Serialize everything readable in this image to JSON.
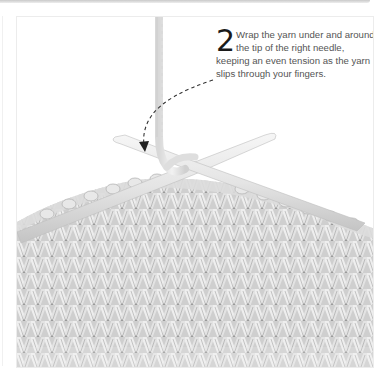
{
  "step": {
    "number": "2",
    "text": "Wrap the yarn under and around the tip of the right needle, keeping an even tension as the yarn slips through your fingers."
  },
  "illustration": {
    "subject": "knitting-right-needle-yarn-wrap",
    "elements": [
      "yarn-strand",
      "dashed-direction-arrow",
      "left-needle",
      "right-needle",
      "stockinette-fabric"
    ],
    "colors": {
      "yarn": "#e6e6e6",
      "yarn_shadow": "#a8a8a8",
      "needle": "#e9e9e9",
      "arrow": "#333333",
      "text": "#555555",
      "numeral": "#1a1a1a"
    }
  }
}
